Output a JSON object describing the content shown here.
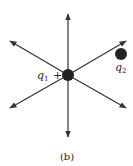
{
  "figure": {
    "caption": "(b)",
    "charges": [
      {
        "symbol": "q",
        "subscript": "1",
        "sign": "+"
      },
      {
        "symbol": "q",
        "subscript": "2"
      }
    ],
    "field_line_count": 6,
    "line_color": "#333333",
    "charge_color": "#222222"
  }
}
